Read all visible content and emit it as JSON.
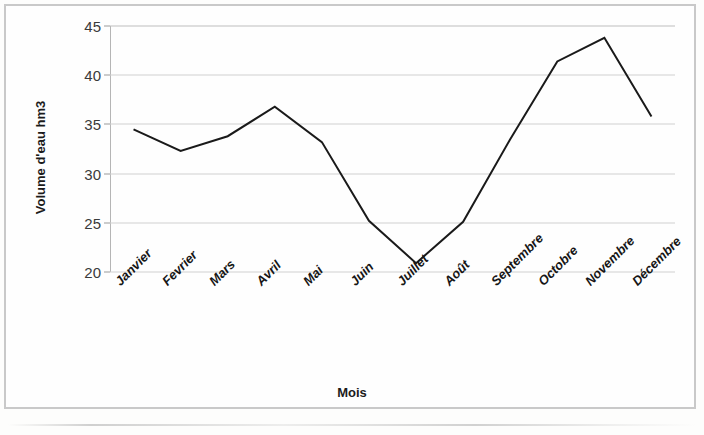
{
  "chart_data": {
    "type": "line",
    "title": "",
    "xlabel": "Mois",
    "ylabel": "Volume d'eau hm3",
    "categories": [
      "Janvier",
      "Fevrier",
      "Mars",
      "Avril",
      "Mai",
      "Juin",
      "Juillet",
      "Août",
      "Septembre",
      "Octobre",
      "Novembre",
      "Décembre"
    ],
    "values": [
      34.5,
      32.3,
      33.8,
      36.8,
      33.2,
      25.2,
      20.9,
      25.1,
      33.5,
      41.4,
      43.8,
      35.8
    ],
    "series": [
      {
        "name": "Volume d'eau hm3",
        "values": [
          34.5,
          32.3,
          33.8,
          36.8,
          33.2,
          25.2,
          20.9,
          25.1,
          33.5,
          41.4,
          43.8,
          35.8
        ]
      }
    ],
    "ylim": [
      20,
      45
    ],
    "yticks": [
      20,
      25,
      30,
      35,
      40,
      45
    ],
    "ytick_labels": [
      "20",
      "25",
      "30",
      "35",
      "40",
      "45"
    ],
    "grid": true,
    "grid_axis": "y",
    "legend": false,
    "legend_position": "none",
    "line_color": "#1a1a1a",
    "line_width": 2,
    "markers": false,
    "grid_color": "#cfcfcf",
    "background_color": "#fefefe",
    "frame_color": "#c9c9c9",
    "xtick_rotation": -45
  }
}
